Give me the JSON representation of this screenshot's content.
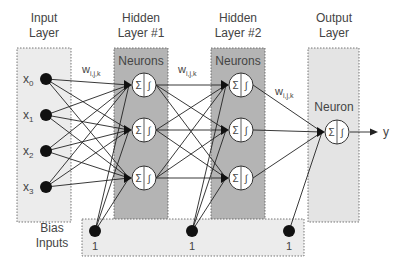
{
  "diagram": {
    "type": "neural-network",
    "layers": [
      {
        "id": "input",
        "title_line1": "Input",
        "title_line2": "Layer",
        "nodes": [
          "x0",
          "x1",
          "x2",
          "x3"
        ],
        "node_labels": [
          {
            "base": "x",
            "sub": "0"
          },
          {
            "base": "x",
            "sub": "1"
          },
          {
            "base": "x",
            "sub": "2"
          },
          {
            "base": "x",
            "sub": "3"
          }
        ]
      },
      {
        "id": "hidden1",
        "title_line1": "Hidden",
        "title_line2": "Layer #1",
        "header": "Neurons",
        "neuron_count": 3
      },
      {
        "id": "hidden2",
        "title_line1": "Hidden",
        "title_line2": "Layer #2",
        "header": "Neurons",
        "neuron_count": 3
      },
      {
        "id": "output",
        "title_line1": "Output",
        "title_line2": "Layer",
        "header": "Neuron",
        "neuron_count": 1
      }
    ],
    "weight_label": {
      "base": "w",
      "sub": "i,j,k"
    },
    "neuron_symbols": {
      "sum": "Σ",
      "activation": "∫"
    },
    "output_label": "y",
    "bias": {
      "title_line1": "Bias",
      "title_line2": "Inputs",
      "values": [
        "1",
        "1",
        "1"
      ]
    },
    "colors": {
      "input_band": "#ececec",
      "hidden_band": "#b4b4b4",
      "output_band": "#e4e4e4",
      "bias_band": "#ececec",
      "node": "#111111",
      "line": "#222222",
      "text": "#444444"
    }
  }
}
